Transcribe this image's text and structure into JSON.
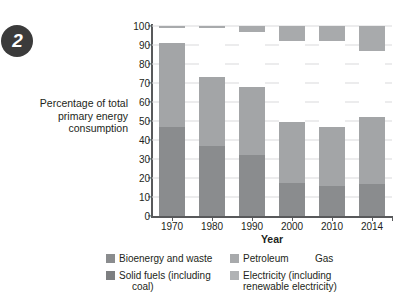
{
  "badge": {
    "number": "2"
  },
  "axis": {
    "ylabel": "Percentage of total primary energy consumption",
    "ylabel_lines": [
      "Percentage of total",
      "primary energy",
      "consumption"
    ],
    "xlabel": "Year"
  },
  "legend": {
    "items": [
      {
        "label": "Bioenergy and waste",
        "color": "#8a8c8e",
        "swatch": true
      },
      {
        "label": "Solid fuels (including",
        "label2": "coal)",
        "color": "#7d7f81",
        "swatch": true
      },
      {
        "label": "Petroleum",
        "color": "#a8aaac",
        "swatch": true
      },
      {
        "label": "Electricity (including",
        "label2": "renewable electricity)",
        "color": "#b0b2b4",
        "swatch": true
      },
      {
        "label": "Gas",
        "color": "#ffffff",
        "swatch": false
      }
    ]
  },
  "colors": {
    "solid_fuels": "#8a8c8e",
    "petroleum": "#a3a5a7",
    "gas": "#ffffff",
    "bioenergy": "#c9cbcc",
    "electricity": "#a8aaac",
    "axis": "#58595b",
    "grid": "#d9dadb",
    "badge_bg": "#3b3b3b"
  },
  "chart_data": {
    "type": "bar",
    "subtype": "stacked-bar",
    "title": "",
    "xlabel": "Year",
    "ylabel": "Percentage of total primary energy consumption",
    "categories": [
      "1970",
      "1980",
      "1990",
      "2000",
      "2010",
      "2014"
    ],
    "ylim": [
      0,
      100
    ],
    "yticks": [
      0,
      10,
      20,
      30,
      40,
      50,
      60,
      70,
      80,
      90,
      100
    ],
    "grid": true,
    "legend_position": "bottom",
    "series": [
      {
        "name": "Solid fuels (including coal)",
        "color": "#8a8c8e",
        "values": [
          47,
          37,
          32,
          17.5,
          16,
          17
        ]
      },
      {
        "name": "Petroleum",
        "color": "#a3a5a7",
        "values": [
          44,
          36,
          36,
          32,
          31,
          35
        ]
      },
      {
        "name": "Gas",
        "color": "#ffffff",
        "values": [
          8,
          26,
          29,
          42.5,
          45,
          35
        ]
      },
      {
        "name": "Electricity (including renewable electricity)",
        "color": "#a8aaac",
        "values": [
          1,
          1,
          3,
          8,
          8,
          13
        ]
      }
    ],
    "cumulative_tops": {
      "1970": [
        47,
        91,
        99,
        100
      ],
      "1980": [
        37,
        73,
        99,
        100
      ],
      "1990": [
        32,
        68,
        97,
        100
      ],
      "2000": [
        17.5,
        49.5,
        92,
        100
      ],
      "2010": [
        16,
        47,
        92,
        100
      ],
      "2014": [
        17,
        52,
        87,
        100
      ]
    }
  }
}
